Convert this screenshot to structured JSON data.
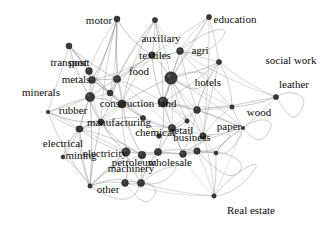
{
  "figure": {
    "type": "network-graph",
    "title": "",
    "background_color": "#ffffff",
    "node_color": "#3a3a3a",
    "node_stroke_color": "#151515",
    "edge_color": "#8c8c8c",
    "label_color": "#0c0c0c",
    "directed": true,
    "self_loops": true
  },
  "chart_data": {
    "type": "scatter",
    "title": "",
    "xlabel": "",
    "ylabel": "",
    "layout": "force-directed",
    "nodes": [
      {
        "id": "motor",
        "label": "motor",
        "x": 117,
        "y": 19,
        "size": 3.0,
        "label_x": 99,
        "label_y": 20,
        "font_size": 11.0
      },
      {
        "id": "auxiliary",
        "label": "auxiliary",
        "x": 155,
        "y": 20,
        "size": 2.6,
        "label_x": 161,
        "label_y": 38,
        "font_size": 11.0
      },
      {
        "id": "education",
        "label": "education",
        "x": 209,
        "y": 17,
        "size": 2.6,
        "label_x": 235,
        "label_y": 19,
        "font_size": 11.0
      },
      {
        "id": "agri",
        "label": "agri",
        "x": 180,
        "y": 51,
        "size": 3.4,
        "label_x": 200,
        "label_y": 50,
        "font_size": 11.0
      },
      {
        "id": "textiles",
        "label": "textiles",
        "x": 152,
        "y": 55,
        "size": 3.2,
        "label_x": 155,
        "label_y": 55,
        "font_size": 11.0
      },
      {
        "id": "social_work",
        "label": "social work",
        "x": 219,
        "y": 62,
        "size": 2.6,
        "label_x": 291,
        "label_y": 60,
        "font_size": 11.0
      },
      {
        "id": "food",
        "label": "food",
        "x": 117,
        "y": 79,
        "size": 3.6,
        "label_x": 139,
        "label_y": 71,
        "font_size": 11.0
      },
      {
        "id": "hotels",
        "label": "hotels",
        "x": 171,
        "y": 78,
        "size": 6.2,
        "label_x": 208,
        "label_y": 82,
        "font_size": 11.0
      },
      {
        "id": "leather",
        "label": "leather",
        "x": 276,
        "y": 97,
        "size": 2.6,
        "label_x": 294,
        "label_y": 84,
        "font_size": 11.0
      },
      {
        "id": "transport",
        "label": "transport",
        "x": 69,
        "y": 46,
        "size": 3.0,
        "label_x": 70,
        "label_y": 62,
        "font_size": 11.0
      },
      {
        "id": "post",
        "label": "post",
        "x": 89,
        "y": 71,
        "size": 3.4,
        "label_x": 78,
        "label_y": 62,
        "font_size": 11.0
      },
      {
        "id": "metals",
        "label": "metals",
        "x": 92,
        "y": 80,
        "size": 3.4,
        "label_x": 76,
        "label_y": 79,
        "font_size": 11.0
      },
      {
        "id": "minerals",
        "label": "minerals",
        "x": 90,
        "y": 97,
        "size": 4.6,
        "label_x": 41,
        "label_y": 92,
        "font_size": 11.0
      },
      {
        "id": "construction",
        "label": "construction",
        "x": 122,
        "y": 104,
        "size": 4.0,
        "label_x": 127,
        "label_y": 103,
        "font_size": 11.0
      },
      {
        "id": "land",
        "label": "land",
        "x": 163,
        "y": 102,
        "size": 5.0,
        "label_x": 167,
        "label_y": 103,
        "font_size": 11.0
      },
      {
        "id": "rubber",
        "label": "rubber",
        "x": 48,
        "y": 112,
        "size": 1.8,
        "label_x": 73,
        "label_y": 110,
        "font_size": 11.0
      },
      {
        "id": "wood",
        "label": "wood",
        "x": 232,
        "y": 107,
        "size": 2.2,
        "label_x": 259,
        "label_y": 112,
        "font_size": 11.0
      },
      {
        "id": "manufacturing",
        "label": "manufacturing",
        "x": 101,
        "y": 122,
        "size": 3.0,
        "label_x": 119,
        "label_y": 122,
        "font_size": 11.0
      },
      {
        "id": "mining",
        "label": "mining",
        "x": 79,
        "y": 129,
        "size": 3.0,
        "label_x": 81,
        "label_y": 155,
        "font_size": 11.0
      },
      {
        "id": "chemical",
        "label": "chemical",
        "x": 172,
        "y": 128,
        "size": 3.6,
        "label_x": 155,
        "label_y": 132,
        "font_size": 11.0
      },
      {
        "id": "retail",
        "label": "retail",
        "x": 197,
        "y": 110,
        "size": 3.4,
        "label_x": 182,
        "label_y": 130,
        "font_size": 11.0
      },
      {
        "id": "business",
        "label": "business",
        "x": 203,
        "y": 136,
        "size": 3.2,
        "label_x": 192,
        "label_y": 137,
        "font_size": 11.0
      },
      {
        "id": "paper",
        "label": "paper",
        "x": 243,
        "y": 128,
        "size": 1.8,
        "label_x": 229,
        "label_y": 126,
        "font_size": 11.0
      },
      {
        "id": "electrical",
        "label": "electrical",
        "x": 80,
        "y": 129,
        "size": 3.0,
        "label_x": 63,
        "label_y": 143,
        "font_size": 11.0
      },
      {
        "id": "electricity",
        "label": "electricity",
        "x": 126,
        "y": 152,
        "size": 4.2,
        "label_x": 105,
        "label_y": 153,
        "font_size": 11.0
      },
      {
        "id": "machinery",
        "label": "machinery",
        "x": 142,
        "y": 155,
        "size": 3.8,
        "label_x": 131,
        "label_y": 168,
        "font_size": 11.0
      },
      {
        "id": "petroleum",
        "label": "petroleum",
        "x": 158,
        "y": 152,
        "size": 3.6,
        "label_x": 134,
        "label_y": 162,
        "font_size": 11.0
      },
      {
        "id": "wholesale",
        "label": "wholesale",
        "x": 183,
        "y": 154,
        "size": 3.4,
        "label_x": 170,
        "label_y": 162,
        "font_size": 11.0
      },
      {
        "id": "other",
        "label": "other",
        "x": 90,
        "y": 186,
        "size": 2.2,
        "label_x": 108,
        "label_y": 189,
        "font_size": 11.0
      },
      {
        "id": "real_estate",
        "label": "Real estate",
        "x": 214,
        "y": 196,
        "size": 2.2,
        "label_x": 251,
        "label_y": 210,
        "font_size": 11.0
      },
      {
        "id": "n_hub_a",
        "label": "",
        "x": 141,
        "y": 183,
        "size": 3.6,
        "label_x": 0,
        "label_y": 0,
        "font_size": 0
      },
      {
        "id": "n_hub_b",
        "label": "",
        "x": 125,
        "y": 183,
        "size": 3.4,
        "label_x": 0,
        "label_y": 0,
        "font_size": 0
      },
      {
        "id": "n_hub_c",
        "label": "",
        "x": 216,
        "y": 153,
        "size": 2.0,
        "label_x": 0,
        "label_y": 0,
        "font_size": 0
      },
      {
        "id": "n_hub_d",
        "label": "",
        "x": 197,
        "y": 151,
        "size": 3.2,
        "label_x": 0,
        "label_y": 0,
        "font_size": 0
      },
      {
        "id": "n_hub_e",
        "label": "",
        "x": 63,
        "y": 157,
        "size": 2.0,
        "label_x": 0,
        "label_y": 0,
        "font_size": 0
      },
      {
        "id": "n_hub_f",
        "label": "",
        "x": 110,
        "y": 93,
        "size": 3.0,
        "label_x": 0,
        "label_y": 0,
        "font_size": 0
      },
      {
        "id": "n_hub_g",
        "label": "",
        "x": 143,
        "y": 118,
        "size": 2.6,
        "label_x": 0,
        "label_y": 0,
        "font_size": 0
      },
      {
        "id": "n_hub_h",
        "label": "",
        "x": 187,
        "y": 121,
        "size": 2.2,
        "label_x": 0,
        "label_y": 0,
        "font_size": 0
      },
      {
        "id": "n_hub_i",
        "label": "",
        "x": 159,
        "y": 136,
        "size": 2.4,
        "label_x": 0,
        "label_y": 0,
        "font_size": 0
      }
    ],
    "edges": [
      [
        "motor",
        "food"
      ],
      [
        "motor",
        "textiles"
      ],
      [
        "motor",
        "metals"
      ],
      [
        "motor",
        "construction"
      ],
      [
        "motor",
        "post"
      ],
      [
        "motor",
        "n_hub_f"
      ],
      [
        "motor",
        "manufacturing"
      ],
      [
        "motor",
        "minerals"
      ],
      [
        "auxiliary",
        "textiles"
      ],
      [
        "auxiliary",
        "food"
      ],
      [
        "auxiliary",
        "agri"
      ],
      [
        "auxiliary",
        "hotels"
      ],
      [
        "auxiliary",
        "construction"
      ],
      [
        "auxiliary",
        "land"
      ],
      [
        "auxiliary",
        "n_hub_f"
      ],
      [
        "education",
        "agri"
      ],
      [
        "education",
        "textiles"
      ],
      [
        "education",
        "hotels"
      ],
      [
        "education",
        "social_work"
      ],
      [
        "education",
        "land"
      ],
      [
        "education",
        "business"
      ],
      [
        "agri",
        "textiles"
      ],
      [
        "agri",
        "hotels"
      ],
      [
        "agri",
        "land"
      ],
      [
        "agri",
        "social_work"
      ],
      [
        "agri",
        "wood"
      ],
      [
        "agri",
        "retail"
      ],
      [
        "agri",
        "leather"
      ],
      [
        "agri",
        "food"
      ],
      [
        "textiles",
        "food"
      ],
      [
        "textiles",
        "construction"
      ],
      [
        "textiles",
        "land"
      ],
      [
        "textiles",
        "hotels"
      ],
      [
        "textiles",
        "n_hub_f"
      ],
      [
        "textiles",
        "metals"
      ],
      [
        "social_work",
        "hotels"
      ],
      [
        "social_work",
        "land"
      ],
      [
        "social_work",
        "leather"
      ],
      [
        "social_work",
        "wood"
      ],
      [
        "social_work",
        "retail"
      ],
      [
        "social_work",
        "business"
      ],
      [
        "food",
        "construction"
      ],
      [
        "food",
        "minerals"
      ],
      [
        "food",
        "metals"
      ],
      [
        "food",
        "n_hub_f"
      ],
      [
        "food",
        "manufacturing"
      ],
      [
        "food",
        "land"
      ],
      [
        "food",
        "chemical"
      ],
      [
        "hotels",
        "land"
      ],
      [
        "hotels",
        "construction"
      ],
      [
        "hotels",
        "retail"
      ],
      [
        "hotels",
        "business"
      ],
      [
        "hotels",
        "chemical"
      ],
      [
        "hotels",
        "wood"
      ],
      [
        "hotels",
        "paper"
      ],
      [
        "hotels",
        "n_hub_h"
      ],
      [
        "leather",
        "wood"
      ],
      [
        "leather",
        "paper"
      ],
      [
        "leather",
        "retail"
      ],
      [
        "transport",
        "post"
      ],
      [
        "transport",
        "metals"
      ],
      [
        "transport",
        "minerals"
      ],
      [
        "transport",
        "food"
      ],
      [
        "transport",
        "construction"
      ],
      [
        "transport",
        "manufacturing"
      ],
      [
        "transport",
        "rubber"
      ],
      [
        "post",
        "metals"
      ],
      [
        "post",
        "minerals"
      ],
      [
        "post",
        "construction"
      ],
      [
        "post",
        "n_hub_f"
      ],
      [
        "metals",
        "minerals"
      ],
      [
        "metals",
        "construction"
      ],
      [
        "metals",
        "manufacturing"
      ],
      [
        "metals",
        "n_hub_f"
      ],
      [
        "minerals",
        "construction"
      ],
      [
        "minerals",
        "manufacturing"
      ],
      [
        "minerals",
        "rubber"
      ],
      [
        "minerals",
        "electrical"
      ],
      [
        "minerals",
        "mining"
      ],
      [
        "minerals",
        "n_hub_f"
      ],
      [
        "minerals",
        "other"
      ],
      [
        "construction",
        "land"
      ],
      [
        "construction",
        "manufacturing"
      ],
      [
        "construction",
        "chemical"
      ],
      [
        "construction",
        "n_hub_g"
      ],
      [
        "construction",
        "electricity"
      ],
      [
        "construction",
        "machinery"
      ],
      [
        "construction",
        "n_hub_f"
      ],
      [
        "construction",
        "mining"
      ],
      [
        "land",
        "chemical"
      ],
      [
        "land",
        "retail"
      ],
      [
        "land",
        "business"
      ],
      [
        "land",
        "n_hub_h"
      ],
      [
        "land",
        "petroleum"
      ],
      [
        "land",
        "wholesale"
      ],
      [
        "land",
        "paper"
      ],
      [
        "land",
        "wood"
      ],
      [
        "rubber",
        "manufacturing"
      ],
      [
        "rubber",
        "mining"
      ],
      [
        "rubber",
        "electrical"
      ],
      [
        "rubber",
        "other"
      ],
      [
        "rubber",
        "minerals"
      ],
      [
        "wood",
        "paper"
      ],
      [
        "wood",
        "retail"
      ],
      [
        "wood",
        "business"
      ],
      [
        "manufacturing",
        "mining"
      ],
      [
        "manufacturing",
        "electrical"
      ],
      [
        "manufacturing",
        "electricity"
      ],
      [
        "manufacturing",
        "machinery"
      ],
      [
        "manufacturing",
        "n_hub_g"
      ],
      [
        "manufacturing",
        "other"
      ],
      [
        "manufacturing",
        "chemical"
      ],
      [
        "mining",
        "electrical"
      ],
      [
        "mining",
        "electricity"
      ],
      [
        "mining",
        "other"
      ],
      [
        "mining",
        "n_hub_e"
      ],
      [
        "chemical",
        "retail"
      ],
      [
        "chemical",
        "business"
      ],
      [
        "chemical",
        "petroleum"
      ],
      [
        "chemical",
        "n_hub_i"
      ],
      [
        "chemical",
        "wholesale"
      ],
      [
        "chemical",
        "n_hub_g"
      ],
      [
        "retail",
        "business"
      ],
      [
        "retail",
        "wholesale"
      ],
      [
        "retail",
        "paper"
      ],
      [
        "retail",
        "n_hub_h"
      ],
      [
        "business",
        "wholesale"
      ],
      [
        "business",
        "paper"
      ],
      [
        "business",
        "real_estate"
      ],
      [
        "business",
        "n_hub_c"
      ],
      [
        "business",
        "n_hub_d"
      ],
      [
        "paper",
        "real_estate"
      ],
      [
        "paper",
        "n_hub_c"
      ],
      [
        "electrical",
        "electricity"
      ],
      [
        "electrical",
        "machinery"
      ],
      [
        "electrical",
        "other"
      ],
      [
        "electricity",
        "machinery"
      ],
      [
        "electricity",
        "petroleum"
      ],
      [
        "electricity",
        "other"
      ],
      [
        "electricity",
        "n_hub_b"
      ],
      [
        "electricity",
        "n_hub_a"
      ],
      [
        "machinery",
        "petroleum"
      ],
      [
        "machinery",
        "wholesale"
      ],
      [
        "machinery",
        "n_hub_a"
      ],
      [
        "machinery",
        "other"
      ],
      [
        "petroleum",
        "wholesale"
      ],
      [
        "petroleum",
        "n_hub_a"
      ],
      [
        "petroleum",
        "n_hub_d"
      ],
      [
        "wholesale",
        "n_hub_d"
      ],
      [
        "wholesale",
        "real_estate"
      ],
      [
        "wholesale",
        "n_hub_c"
      ],
      [
        "other",
        "n_hub_b"
      ],
      [
        "other",
        "n_hub_e"
      ],
      [
        "other",
        "electricity"
      ],
      [
        "n_hub_f",
        "n_hub_g"
      ],
      [
        "n_hub_g",
        "n_hub_i"
      ],
      [
        "n_hub_i",
        "n_hub_h"
      ],
      [
        "n_hub_h",
        "n_hub_d"
      ],
      [
        "n_hub_d",
        "n_hub_c"
      ],
      [
        "n_hub_a",
        "n_hub_b"
      ],
      [
        "n_hub_e",
        "mining"
      ],
      [
        "n_hub_a",
        "real_estate"
      ],
      [
        "n_hub_b",
        "real_estate"
      ],
      [
        "n_hub_d",
        "real_estate"
      ],
      [
        "n_hub_c",
        "real_estate"
      ]
    ],
    "self_loop_nodes": [
      "agri",
      "leather",
      "paper",
      "n_hub_c",
      "n_hub_a",
      "n_hub_b",
      "other",
      "real_estate",
      "wholesale",
      "n_hub_d",
      "hotels"
    ]
  }
}
